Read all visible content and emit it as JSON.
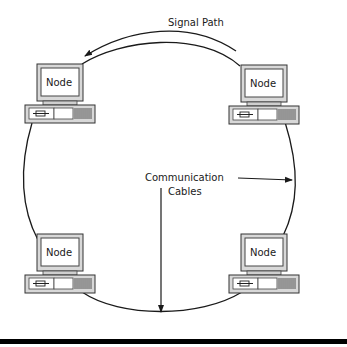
{
  "diagram": {
    "type": "ring-network-topology",
    "labels": {
      "signal_path": "Signal Path",
      "cables_line1": "Communication",
      "cables_line2": "Cables"
    },
    "nodes": [
      {
        "id": "top-left",
        "label": "Node"
      },
      {
        "id": "top-right",
        "label": "Node"
      },
      {
        "id": "bottom-left",
        "label": "Node"
      },
      {
        "id": "bottom-right",
        "label": "Node"
      }
    ],
    "colors": {
      "line": "#1a1a1a",
      "monitor_bezel": "#d8d8d8",
      "screen": "#ffffff",
      "bottom_bar": "#000000"
    }
  }
}
